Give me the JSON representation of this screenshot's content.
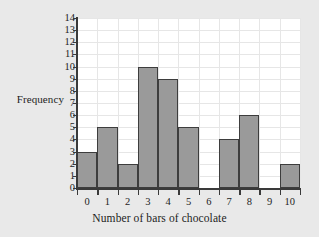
{
  "chart_data": {
    "type": "bar",
    "title": "",
    "xlabel": "Number of bars of chocolate",
    "ylabel": "Frequency",
    "categories": [
      "0",
      "1",
      "2",
      "3",
      "4",
      "5",
      "6",
      "7",
      "8",
      "9",
      "10"
    ],
    "values": [
      3,
      5,
      2,
      10,
      9,
      5,
      0,
      4,
      6,
      0,
      2
    ],
    "x_tick_labels": [
      "0",
      "1",
      "2",
      "3",
      "4",
      "5",
      "6",
      "7",
      "8",
      "9",
      "10"
    ],
    "y_tick_labels": [
      "0",
      "1",
      "2",
      "3",
      "4",
      "5",
      "6",
      "7",
      "8",
      "9",
      "10",
      "11",
      "12",
      "13",
      "14"
    ],
    "ylim": [
      0,
      14
    ],
    "xlim": [
      -0.5,
      10.5
    ],
    "y_tick_step": 1,
    "grid": true,
    "legend": false,
    "legend_position": "none",
    "colors": {
      "bar_fill": "#9a9a9a",
      "bar_edge": "#3d3d3d",
      "grid": "#e6e6e6",
      "axis": "#3a3a3a",
      "plot_background": "#ffffff",
      "page_background": "#e9e9e9",
      "text": "#1d1d1d"
    }
  }
}
